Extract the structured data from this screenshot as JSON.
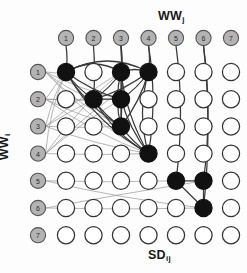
{
  "figure": {
    "type": "bipartite-grid-network-diagram",
    "background_color": "#fdfdfd"
  },
  "labels": {
    "top": {
      "text": "WW",
      "subscript": "j"
    },
    "left": {
      "text": "WW",
      "subscript": "i"
    },
    "bottom": {
      "text": "SD",
      "subscript": "ij"
    }
  },
  "colors": {
    "header_fill": "#b3b3b3",
    "header_stroke": "#555555",
    "node_open_fill": "#ffffff",
    "node_open_stroke": "#333333",
    "node_filled_fill": "#111111",
    "node_filled_stroke": "#111111",
    "edge_light": "#9a9a9a",
    "edge_dark": "#3a3a3a",
    "text": "#1a1a1a"
  },
  "grid": {
    "rows": 7,
    "cols": 7,
    "origin_x": 66,
    "origin_y": 72,
    "spacing_x": 27.5,
    "spacing_y": 27.2,
    "node_radius": 8.6,
    "header_radius": 7.6,
    "top_header_y": 38,
    "left_header_x": 38
  },
  "col_headers": [
    {
      "id": 1,
      "label": "1"
    },
    {
      "id": 2,
      "label": "2"
    },
    {
      "id": 3,
      "label": "3"
    },
    {
      "id": 4,
      "label": "4"
    },
    {
      "id": 5,
      "label": "5"
    },
    {
      "id": 6,
      "label": "6"
    },
    {
      "id": 7,
      "label": "7"
    }
  ],
  "row_headers": [
    {
      "id": 1,
      "label": "1"
    },
    {
      "id": 2,
      "label": "2"
    },
    {
      "id": 3,
      "label": "3"
    },
    {
      "id": 4,
      "label": "4"
    },
    {
      "id": 5,
      "label": "5"
    },
    {
      "id": 6,
      "label": "6"
    },
    {
      "id": 7,
      "label": "7"
    }
  ],
  "filled_nodes": [
    {
      "row": 1,
      "col": 1
    },
    {
      "row": 1,
      "col": 3
    },
    {
      "row": 1,
      "col": 4
    },
    {
      "row": 2,
      "col": 2
    },
    {
      "row": 2,
      "col": 3
    },
    {
      "row": 3,
      "col": 3
    },
    {
      "row": 4,
      "col": 4
    },
    {
      "row": 5,
      "col": 5
    },
    {
      "row": 5,
      "col": 6
    },
    {
      "row": 6,
      "col": 6
    }
  ],
  "col_header_edges": [
    {
      "from_col": 1,
      "to": {
        "row": 1,
        "col": 1
      },
      "style": "dark"
    },
    {
      "from_col": 2,
      "to": {
        "row": 2,
        "col": 2
      },
      "style": "dark"
    },
    {
      "from_col": 3,
      "to": {
        "row": 1,
        "col": 3
      },
      "style": "dark"
    },
    {
      "from_col": 3,
      "to": {
        "row": 2,
        "col": 3
      },
      "style": "dark"
    },
    {
      "from_col": 3,
      "to": {
        "row": 3,
        "col": 3
      },
      "style": "dark"
    },
    {
      "from_col": 4,
      "to": {
        "row": 1,
        "col": 4
      },
      "style": "dark"
    },
    {
      "from_col": 4,
      "to": {
        "row": 4,
        "col": 4
      },
      "style": "dark"
    },
    {
      "from_col": 5,
      "to": {
        "row": 5,
        "col": 5
      },
      "style": "dark"
    },
    {
      "from_col": 6,
      "to": {
        "row": 5,
        "col": 6
      },
      "style": "dark"
    },
    {
      "from_col": 6,
      "to": {
        "row": 6,
        "col": 6
      },
      "style": "dark"
    }
  ],
  "row_header_edges": [
    {
      "from_row": 1,
      "to": {
        "row": 1,
        "col": 1
      },
      "style": "light"
    },
    {
      "from_row": 1,
      "to": {
        "row": 2,
        "col": 2
      },
      "style": "light"
    },
    {
      "from_row": 1,
      "to": {
        "row": 2,
        "col": 3
      },
      "style": "light"
    },
    {
      "from_row": 1,
      "to": {
        "row": 3,
        "col": 3
      },
      "style": "light"
    },
    {
      "from_row": 1,
      "to": {
        "row": 4,
        "col": 4
      },
      "style": "light"
    },
    {
      "from_row": 2,
      "to": {
        "row": 1,
        "col": 1
      },
      "style": "light"
    },
    {
      "from_row": 2,
      "to": {
        "row": 2,
        "col": 2
      },
      "style": "light"
    },
    {
      "from_row": 2,
      "to": {
        "row": 2,
        "col": 3
      },
      "style": "light"
    },
    {
      "from_row": 2,
      "to": {
        "row": 3,
        "col": 3
      },
      "style": "light"
    },
    {
      "from_row": 2,
      "to": {
        "row": 4,
        "col": 4
      },
      "style": "light"
    },
    {
      "from_row": 3,
      "to": {
        "row": 1,
        "col": 1
      },
      "style": "light"
    },
    {
      "from_row": 3,
      "to": {
        "row": 1,
        "col": 3
      },
      "style": "light"
    },
    {
      "from_row": 3,
      "to": {
        "row": 2,
        "col": 2
      },
      "style": "light"
    },
    {
      "from_row": 3,
      "to": {
        "row": 3,
        "col": 3
      },
      "style": "light"
    },
    {
      "from_row": 3,
      "to": {
        "row": 4,
        "col": 4
      },
      "style": "light"
    },
    {
      "from_row": 4,
      "to": {
        "row": 1,
        "col": 1
      },
      "style": "light"
    },
    {
      "from_row": 4,
      "to": {
        "row": 1,
        "col": 3
      },
      "style": "light"
    },
    {
      "from_row": 4,
      "to": {
        "row": 1,
        "col": 4
      },
      "style": "light"
    },
    {
      "from_row": 4,
      "to": {
        "row": 2,
        "col": 3
      },
      "style": "light"
    },
    {
      "from_row": 4,
      "to": {
        "row": 4,
        "col": 4
      },
      "style": "light"
    },
    {
      "from_row": 5,
      "to": {
        "row": 5,
        "col": 5
      },
      "style": "light"
    },
    {
      "from_row": 5,
      "to": {
        "row": 6,
        "col": 6
      },
      "style": "light"
    },
    {
      "from_row": 6,
      "to": {
        "row": 5,
        "col": 6
      },
      "style": "light"
    },
    {
      "from_row": 6,
      "to": {
        "row": 6,
        "col": 6
      },
      "style": "light"
    }
  ],
  "node_edges": [
    {
      "a": {
        "row": 1,
        "col": 1
      },
      "b": {
        "row": 1,
        "col": 3
      },
      "style": "dark",
      "curve": -16
    },
    {
      "a": {
        "row": 1,
        "col": 1
      },
      "b": {
        "row": 1,
        "col": 4
      },
      "style": "dark",
      "curve": -22
    },
    {
      "a": {
        "row": 1,
        "col": 1
      },
      "b": {
        "row": 2,
        "col": 2
      },
      "style": "dark",
      "curve": 4
    },
    {
      "a": {
        "row": 1,
        "col": 1
      },
      "b": {
        "row": 2,
        "col": 3
      },
      "style": "dark",
      "curve": 6
    },
    {
      "a": {
        "row": 1,
        "col": 1
      },
      "b": {
        "row": 3,
        "col": 3
      },
      "style": "dark",
      "curve": 10
    },
    {
      "a": {
        "row": 1,
        "col": 1
      },
      "b": {
        "row": 4,
        "col": 4
      },
      "style": "dark",
      "curve": 16
    },
    {
      "a": {
        "row": 1,
        "col": 3
      },
      "b": {
        "row": 1,
        "col": 4
      },
      "style": "dark",
      "curve": -5
    },
    {
      "a": {
        "row": 1,
        "col": 3
      },
      "b": {
        "row": 2,
        "col": 2
      },
      "style": "dark",
      "curve": -4
    },
    {
      "a": {
        "row": 1,
        "col": 3
      },
      "b": {
        "row": 2,
        "col": 3
      },
      "style": "dark",
      "curve": 0
    },
    {
      "a": {
        "row": 1,
        "col": 3
      },
      "b": {
        "row": 3,
        "col": 3
      },
      "style": "dark",
      "curve": 7
    },
    {
      "a": {
        "row": 1,
        "col": 3
      },
      "b": {
        "row": 4,
        "col": 4
      },
      "style": "dark",
      "curve": 9
    },
    {
      "a": {
        "row": 1,
        "col": 4
      },
      "b": {
        "row": 2,
        "col": 2
      },
      "style": "dark",
      "curve": -6
    },
    {
      "a": {
        "row": 1,
        "col": 4
      },
      "b": {
        "row": 2,
        "col": 3
      },
      "style": "dark",
      "curve": -4
    },
    {
      "a": {
        "row": 1,
        "col": 4
      },
      "b": {
        "row": 3,
        "col": 3
      },
      "style": "dark",
      "curve": -6
    },
    {
      "a": {
        "row": 1,
        "col": 4
      },
      "b": {
        "row": 4,
        "col": 4
      },
      "style": "dark",
      "curve": 12
    },
    {
      "a": {
        "row": 2,
        "col": 2
      },
      "b": {
        "row": 2,
        "col": 3
      },
      "style": "dark",
      "curve": 0
    },
    {
      "a": {
        "row": 2,
        "col": 2
      },
      "b": {
        "row": 3,
        "col": 3
      },
      "style": "dark",
      "curve": 4
    },
    {
      "a": {
        "row": 2,
        "col": 2
      },
      "b": {
        "row": 4,
        "col": 4
      },
      "style": "dark",
      "curve": 10
    },
    {
      "a": {
        "row": 2,
        "col": 3
      },
      "b": {
        "row": 3,
        "col": 3
      },
      "style": "dark",
      "curve": 0
    },
    {
      "a": {
        "row": 2,
        "col": 3
      },
      "b": {
        "row": 4,
        "col": 4
      },
      "style": "dark",
      "curve": 6
    },
    {
      "a": {
        "row": 3,
        "col": 3
      },
      "b": {
        "row": 4,
        "col": 4
      },
      "style": "dark",
      "curve": 3
    },
    {
      "a": {
        "row": 5,
        "col": 5
      },
      "b": {
        "row": 5,
        "col": 6
      },
      "style": "dark",
      "curve": 0
    },
    {
      "a": {
        "row": 5,
        "col": 5
      },
      "b": {
        "row": 6,
        "col": 6
      },
      "style": "dark",
      "curve": 0
    },
    {
      "a": {
        "row": 5,
        "col": 6
      },
      "b": {
        "row": 6,
        "col": 6
      },
      "style": "dark",
      "curve": 0
    }
  ]
}
